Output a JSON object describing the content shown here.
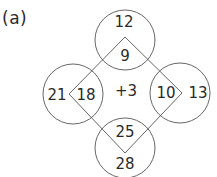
{
  "label": "(a)",
  "center_operation": "+3",
  "circles": [
    {
      "position": "top",
      "outer": "12",
      "inner": "9"
    },
    {
      "position": "left",
      "outer": "21",
      "inner": "18"
    },
    {
      "position": "right",
      "outer": "13",
      "inner": "10"
    },
    {
      "position": "bottom",
      "outer": "28",
      "inner": "25"
    }
  ],
  "colors": {
    "stroke": "#555555",
    "text": "#2a2a2a",
    "background": "#ffffff"
  }
}
